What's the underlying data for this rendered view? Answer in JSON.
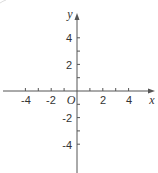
{
  "chart_data": {
    "type": "scatter",
    "title": "",
    "xlabel": "x",
    "ylabel": "y",
    "origin_label": "O",
    "x_ticks": [
      -4,
      -3,
      -2,
      -1,
      1,
      2,
      3,
      4
    ],
    "y_ticks": [
      -4,
      -3,
      -2,
      -1,
      1,
      2,
      3,
      4
    ],
    "x_tick_labels": [
      "-4",
      "-2",
      "2",
      "4"
    ],
    "y_tick_labels": [
      "4",
      "2",
      "-2",
      "-4"
    ],
    "xlim": [
      -6,
      6
    ],
    "ylim": [
      -6,
      6
    ],
    "grid": false,
    "legend": null,
    "series": []
  },
  "colors": {
    "axis": "#555555",
    "text": "#333333"
  }
}
